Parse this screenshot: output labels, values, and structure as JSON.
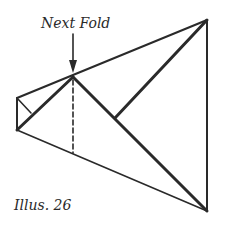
{
  "diagram": {
    "type": "origami-fold-illustration",
    "annotation": "Next Fold",
    "caption": "Illus. 26",
    "stroke_color": "#2a2a2a",
    "background": "#ffffff",
    "elements": {
      "arrow": "down-arrow pointing to fold point",
      "dashed_line": "next fold crease (vertical)",
      "outline": "kite-shaped folded paper"
    }
  }
}
